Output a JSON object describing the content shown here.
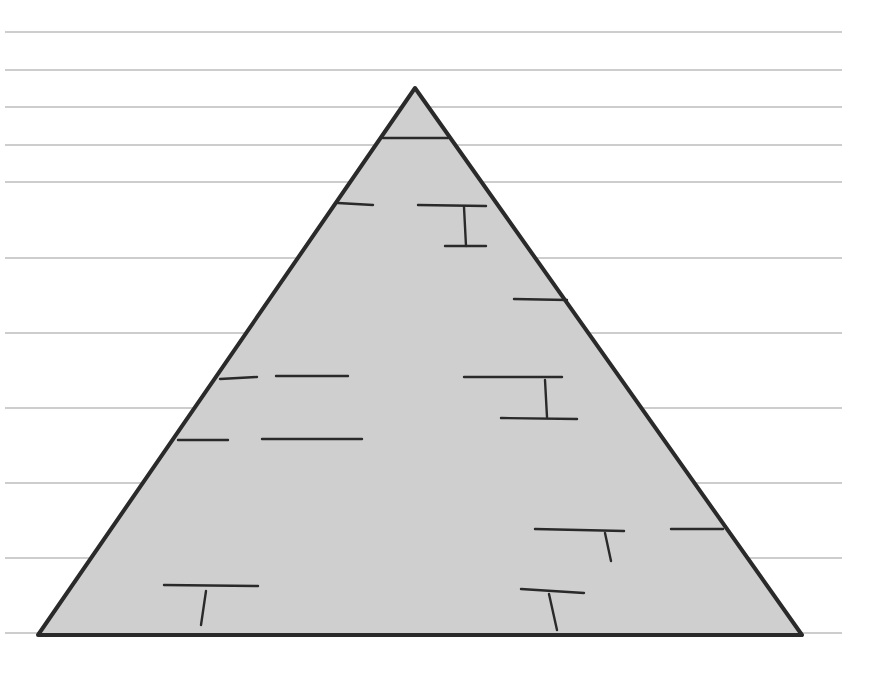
{
  "illustration": {
    "subject": "stone pyramid drawing on ruled paper",
    "colors": {
      "background": "#ffffff",
      "rule_line": "#bdbdbd",
      "pyramid_fill": "#cfcfcf",
      "outline": "#2a2a2a"
    },
    "rule_lines": {
      "x_start": 5,
      "x_end": 842,
      "y": [
        32,
        70,
        107,
        145,
        182,
        258,
        333,
        408,
        483,
        558,
        633
      ]
    },
    "pyramid": {
      "apex": [
        415,
        88
      ],
      "base_left": [
        38,
        635
      ],
      "base_right": [
        802,
        635
      ]
    },
    "brick_marks": [
      {
        "x1": 383,
        "y1": 138,
        "x2": 448,
        "y2": 138
      },
      {
        "x1": 338,
        "y1": 203,
        "x2": 373,
        "y2": 205
      },
      {
        "x1": 418,
        "y1": 205,
        "x2": 486,
        "y2": 206
      },
      {
        "x1": 464,
        "y1": 207,
        "x2": 466,
        "y2": 246
      },
      {
        "x1": 445,
        "y1": 246,
        "x2": 486,
        "y2": 246
      },
      {
        "x1": 514,
        "y1": 299,
        "x2": 567,
        "y2": 300
      },
      {
        "x1": 220,
        "y1": 379,
        "x2": 257,
        "y2": 377
      },
      {
        "x1": 276,
        "y1": 376,
        "x2": 348,
        "y2": 376
      },
      {
        "x1": 464,
        "y1": 377,
        "x2": 562,
        "y2": 377
      },
      {
        "x1": 545,
        "y1": 380,
        "x2": 547,
        "y2": 417
      },
      {
        "x1": 501,
        "y1": 418,
        "x2": 577,
        "y2": 419
      },
      {
        "x1": 178,
        "y1": 440,
        "x2": 228,
        "y2": 440
      },
      {
        "x1": 262,
        "y1": 439,
        "x2": 362,
        "y2": 439
      },
      {
        "x1": 535,
        "y1": 529,
        "x2": 624,
        "y2": 531
      },
      {
        "x1": 605,
        "y1": 533,
        "x2": 611,
        "y2": 561
      },
      {
        "x1": 671,
        "y1": 529,
        "x2": 723,
        "y2": 529
      },
      {
        "x1": 164,
        "y1": 585,
        "x2": 258,
        "y2": 586
      },
      {
        "x1": 206,
        "y1": 591,
        "x2": 201,
        "y2": 625
      },
      {
        "x1": 521,
        "y1": 589,
        "x2": 584,
        "y2": 593
      },
      {
        "x1": 549,
        "y1": 594,
        "x2": 557,
        "y2": 630
      }
    ]
  }
}
